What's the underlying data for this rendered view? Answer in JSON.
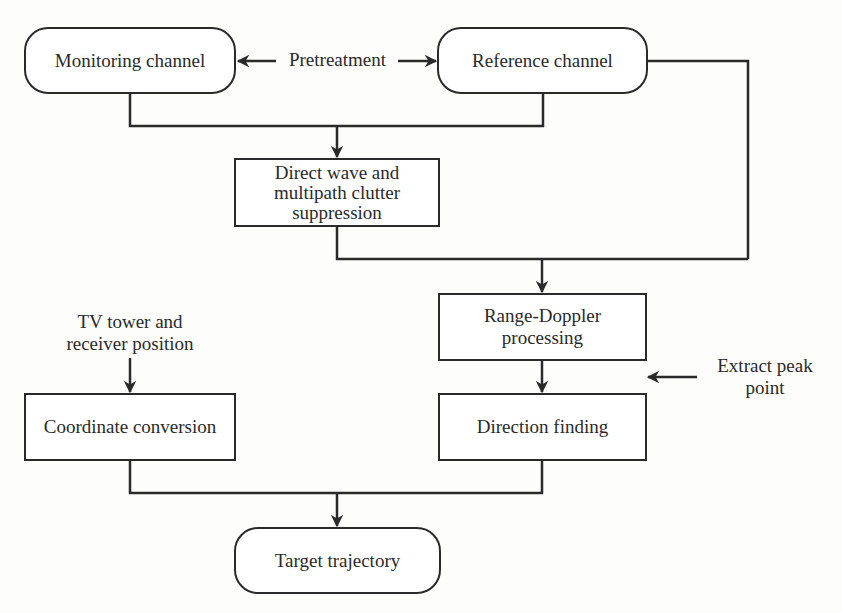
{
  "diagram": {
    "type": "flowchart",
    "nodes": {
      "monitoring": "Monitoring channel",
      "reference": "Reference channel",
      "suppression_line1": "Direct wave and",
      "suppression_line2": "multipath clutter",
      "suppression_line3": "suppression",
      "range_doppler_line1": "Range-Doppler",
      "range_doppler_line2": "processing",
      "direction_finding": "Direction finding",
      "coordinate_conversion": "Coordinate conversion",
      "target_trajectory": "Target trajectory"
    },
    "labels": {
      "pretreatment": "Pretreatment",
      "tv_tower_line1": "TV tower and",
      "tv_tower_line2": "receiver position",
      "extract_peak_line1": "Extract peak",
      "extract_peak_line2": "point"
    },
    "edges": [
      {
        "from": "Pretreatment",
        "to": "Monitoring channel"
      },
      {
        "from": "Pretreatment",
        "to": "Reference channel"
      },
      {
        "from": "Monitoring channel",
        "to": "Direct wave and multipath clutter suppression"
      },
      {
        "from": "Reference channel",
        "to": "Direct wave and multipath clutter suppression"
      },
      {
        "from": "Direct wave and multipath clutter suppression",
        "to": "Range-Doppler processing"
      },
      {
        "from": "Reference channel",
        "to": "Range-Doppler processing"
      },
      {
        "from": "Range-Doppler processing",
        "to": "Direction finding"
      },
      {
        "from": "Extract peak point",
        "to": "Direction finding"
      },
      {
        "from": "TV tower and receiver position",
        "to": "Coordinate conversion"
      },
      {
        "from": "Coordinate conversion",
        "to": "Target trajectory"
      },
      {
        "from": "Direction finding",
        "to": "Target trajectory"
      }
    ]
  }
}
